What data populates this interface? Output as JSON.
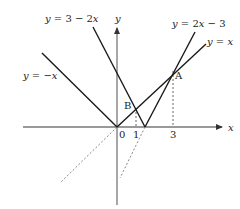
{
  "diagram": {
    "axes": {
      "x_label": "x",
      "y_label": "y",
      "origin_label": "0",
      "x_ticks": [
        {
          "value": 1,
          "label": "1"
        },
        {
          "value": 3,
          "label": "3"
        }
      ]
    },
    "lines": [
      {
        "name": "y-neg-x",
        "label": "y = −x"
      },
      {
        "name": "y-3-minus-2x",
        "label": "y = 3 − 2x"
      },
      {
        "name": "y-2x-minus-3",
        "label": "y = 2x − 3"
      },
      {
        "name": "y-x",
        "label": "y = x"
      }
    ],
    "points": [
      {
        "name": "A",
        "label": "A",
        "x": 3,
        "y": 3
      },
      {
        "name": "B",
        "label": "B",
        "x": 1,
        "y": 1
      }
    ],
    "colors": {
      "line": "#1a1a1a",
      "axis": "#777777",
      "dashed": "#888888"
    }
  }
}
